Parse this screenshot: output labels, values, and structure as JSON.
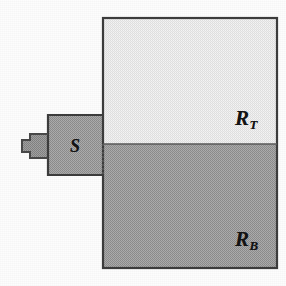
{
  "figure": {
    "caption": "",
    "background_color": "#fdfdfd",
    "labels": {
      "top_region": {
        "base": "R",
        "subscript": "T",
        "full": "R_T"
      },
      "bottom_region": {
        "base": "R",
        "subscript": "B",
        "full": "R_B"
      },
      "left_block": {
        "base": "S",
        "subscript": "",
        "full": "S"
      }
    },
    "regions": [
      {
        "name": "top-region",
        "label": "R_T",
        "fill_color": "#e9e9e9",
        "stroke_color": "#3a3a3a",
        "x": 103,
        "y": 18,
        "width": 174,
        "height": 126
      },
      {
        "name": "bottom-region",
        "label": "R_B",
        "fill_color": "#9c9c9c",
        "stroke_color": "#3a3a3a",
        "x": 103,
        "y": 144,
        "width": 174,
        "height": 124
      },
      {
        "name": "left-block",
        "label": "S",
        "fill_color": "#9c9c9c",
        "stroke_color": "#3a3a3a",
        "x": 48,
        "y": 115,
        "width": 55,
        "height": 60
      },
      {
        "name": "left-tab",
        "label": "",
        "fill_color": "#8e8e8e",
        "stroke_color": "#3a3a3a",
        "x": 18,
        "y": 134,
        "width": 30,
        "height": 24
      }
    ],
    "divider": {
      "name": "region-divider",
      "y": 144,
      "x_start": 103,
      "x_end": 277,
      "stroke_color": "#555555"
    }
  }
}
